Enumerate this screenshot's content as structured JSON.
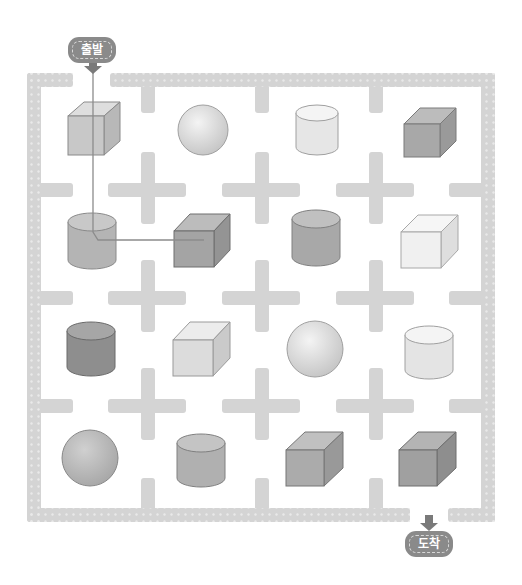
{
  "puzzle": {
    "start_label": "출발",
    "end_label": "도착",
    "colors": {
      "wall": "#d4d4d4",
      "wall_dot": "#ececec",
      "badge": "#8a8a8a",
      "arrow": "#7a7a7a",
      "path_line": "#8c8c8c"
    },
    "grid": {
      "rows": 4,
      "cols": 4,
      "cells": [
        [
          {
            "shape": "cube",
            "shade": "#c8c8c8"
          },
          {
            "shape": "sphere",
            "shade": "#e6e6e6"
          },
          {
            "shape": "cylinder",
            "shade": "#ececec"
          },
          {
            "shape": "cube",
            "shade": "#a8a8a8"
          }
        ],
        [
          {
            "shape": "cylinder",
            "shade": "#b4b4b4"
          },
          {
            "shape": "cube",
            "shade": "#a4a4a4"
          },
          {
            "shape": "cylinder",
            "shade": "#a8a8a8"
          },
          {
            "shape": "cube",
            "shade": "#f0f0f0"
          }
        ],
        [
          {
            "shape": "cylinder",
            "shade": "#8e8e8e"
          },
          {
            "shape": "cube",
            "shade": "#dcdcdc"
          },
          {
            "shape": "sphere",
            "shade": "#e4e4e4"
          },
          {
            "shape": "cylinder",
            "shade": "#ececec"
          }
        ],
        [
          {
            "shape": "sphere",
            "shade": "#bcbcbc"
          },
          {
            "shape": "cylinder",
            "shade": "#b0b0b0"
          },
          {
            "shape": "cube",
            "shade": "#ababab"
          },
          {
            "shape": "cube",
            "shade": "#a0a0a0"
          }
        ]
      ]
    },
    "drawn_path": [
      [
        93,
        73
      ],
      [
        93,
        240
      ],
      [
        204,
        240
      ]
    ]
  }
}
